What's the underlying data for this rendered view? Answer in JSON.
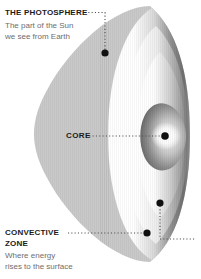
{
  "diagram": {
    "background_color": "#ffffff",
    "disc_color": "#c9c9c9",
    "marker_color": "#111111",
    "leader_color": "#4d4d4d",
    "title_color": "#1a1a1a",
    "body_color": "#6e6e6e",
    "shell_highlight_color": "#ffffff",
    "shell_shadow_color": "#5a5a5a"
  },
  "labels": {
    "photosphere": {
      "title": "THE PHOTOSPHERE",
      "body": "The part of the Sun\nwe see from Earth"
    },
    "core": {
      "title": "CORE",
      "body": ""
    },
    "convective": {
      "title": "CONVECTIVE\nZONE",
      "body": "Where energy\nrises to the surface"
    }
  },
  "markers": [
    {
      "name": "photosphere-marker",
      "x": 105,
      "y": 53
    },
    {
      "name": "core-marker",
      "x": 165,
      "y": 136
    },
    {
      "name": "convective-upper-marker",
      "x": 160,
      "y": 203
    },
    {
      "name": "convective-lower-marker",
      "x": 147,
      "y": 233
    }
  ]
}
